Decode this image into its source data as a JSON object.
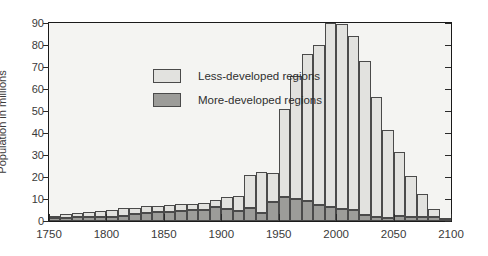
{
  "chart_data": {
    "type": "bar",
    "title": "",
    "subtitle": "",
    "xlabel": "",
    "ylabel": "Population in millions",
    "stacked": true,
    "xlim": [
      1750,
      2100
    ],
    "ylim": [
      0,
      90
    ],
    "grid": false,
    "legend_position": "upper-left-inside",
    "bar_width_years": 10,
    "y_ticks": [
      0,
      10,
      20,
      30,
      40,
      50,
      60,
      70,
      80,
      90
    ],
    "y_tick_labels": [
      "0",
      "10",
      "20",
      "30",
      "40",
      "50",
      "60",
      "70",
      "80",
      "90"
    ],
    "x_ticks": [
      1750,
      1800,
      1850,
      1900,
      1950,
      2000,
      2050,
      2100
    ],
    "x_tick_labels": [
      "1750",
      "1800",
      "1850",
      "1900",
      "1950",
      "2000",
      "2050",
      "2100"
    ],
    "x": [
      1750,
      1760,
      1770,
      1780,
      1790,
      1800,
      1810,
      1820,
      1830,
      1840,
      1850,
      1860,
      1870,
      1880,
      1890,
      1900,
      1910,
      1920,
      1930,
      1940,
      1950,
      1960,
      1970,
      1980,
      1990,
      2000,
      2010,
      2020,
      2030,
      2040,
      2050,
      2060,
      2070,
      2080,
      2090
    ],
    "series": [
      {
        "name": "More-developed regions",
        "color": "#9c9c99",
        "values": [
          1.2,
          1.4,
          1.6,
          1.7,
          1.9,
          1.6,
          2.1,
          3.0,
          3.6,
          4.1,
          4.2,
          4.5,
          5.0,
          5.2,
          6.4,
          5.5,
          4.4,
          6.1,
          3.7,
          8.8,
          11.1,
          10.1,
          9.1,
          7.3,
          6.5,
          5.5,
          5.1,
          2.8,
          2.0,
          1.4,
          2.2,
          1.6,
          1.6,
          1.9,
          0.3
        ]
      },
      {
        "name": "Less-developed regions",
        "color": "#e2e2df",
        "values": [
          1.3,
          1.8,
          2.2,
          2.6,
          2.8,
          3.2,
          3.6,
          3.0,
          3.2,
          2.9,
          3.3,
          3.1,
          2.8,
          3.1,
          3.3,
          5.4,
          7.0,
          14.8,
          18.5,
          13.2,
          39.6,
          56.0,
          67.0,
          72.8,
          83.5,
          84.0,
          78.8,
          70.0,
          54.5,
          40.1,
          29.2,
          18.9,
          10.6,
          3.4,
          0.2
        ]
      }
    ],
    "totals": [
      2.5,
      3.2,
      3.8,
      4.3,
      4.7,
      4.8,
      5.7,
      6.0,
      6.8,
      7.0,
      7.5,
      7.6,
      7.8,
      8.3,
      9.7,
      10.9,
      11.4,
      20.9,
      22.2,
      22.0,
      50.7,
      66.1,
      76.1,
      80.1,
      90.0,
      89.5,
      83.9,
      72.8,
      56.5,
      41.5,
      31.4,
      20.5,
      12.2,
      5.3,
      0.5
    ]
  },
  "legend": {
    "items": [
      {
        "label": "Less-developed regions",
        "swatch": "light-gray"
      },
      {
        "label": "More-developed regions",
        "swatch": "dark-gray"
      }
    ]
  },
  "axis": {
    "y_title": "Population in millions"
  }
}
